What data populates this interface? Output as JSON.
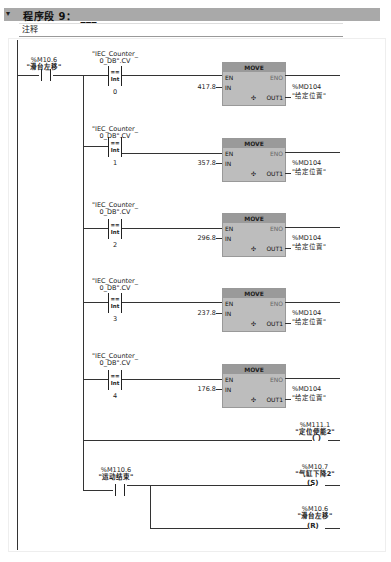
{
  "network": {
    "collapse_icon": "▾",
    "title": "程序段 9：  ___",
    "comment_label": "注释"
  },
  "rows": [
    {
      "contact": {
        "address": "%M10.6",
        "symbol": "\"滑台左移\""
      },
      "compare": {
        "operand1": "\"IEC_Counter_",
        "operand2": "0_DB\".CV",
        "op": "==",
        "type": "Int",
        "value": "0"
      },
      "move": {
        "title": "MOVE",
        "en": "EN",
        "eno": "ENO",
        "in": "IN",
        "out": "OUT1",
        "in_value": "417.8",
        "out_address": "%MD104",
        "out_symbol": "\"给定位置\""
      }
    },
    {
      "compare": {
        "operand1": "\"IEC_Counter_",
        "operand2": "0_DB\".CV",
        "op": "==",
        "type": "Int",
        "value": "1"
      },
      "move": {
        "title": "MOVE",
        "en": "EN",
        "eno": "ENO",
        "in": "IN",
        "out": "OUT1",
        "in_value": "357.8",
        "out_address": "%MD104",
        "out_symbol": "\"给定位置\""
      }
    },
    {
      "compare": {
        "operand1": "\"IEC_Counter_",
        "operand2": "0_DB\".CV",
        "op": "==",
        "type": "Int",
        "value": "2"
      },
      "move": {
        "title": "MOVE",
        "en": "EN",
        "eno": "ENO",
        "in": "IN",
        "out": "OUT1",
        "in_value": "296.8",
        "out_address": "%MD104",
        "out_symbol": "\"给定位置\""
      }
    },
    {
      "compare": {
        "operand1": "\"IEC_Counter_",
        "operand2": "0_DB\".CV",
        "op": "==",
        "type": "Int",
        "value": "3"
      },
      "move": {
        "title": "MOVE",
        "en": "EN",
        "eno": "ENO",
        "in": "IN",
        "out": "OUT1",
        "in_value": "237.8",
        "out_address": "%MD104",
        "out_symbol": "\"给定位置\""
      }
    },
    {
      "compare": {
        "operand1": "\"IEC_Counter_",
        "operand2": "0_DB\".CV",
        "op": "==",
        "type": "Int",
        "value": "4"
      },
      "move": {
        "title": "MOVE",
        "en": "EN",
        "eno": "ENO",
        "in": "IN",
        "out": "OUT1",
        "in_value": "176.8",
        "out_address": "%MD104",
        "out_symbol": "\"给定位置\""
      }
    }
  ],
  "coils": [
    {
      "address": "%M111.1",
      "symbol": "\"定位使能2\"",
      "glyph": "( )"
    },
    {
      "address": "%M10.7",
      "symbol": "\"气缸下降2\"",
      "glyph": "(S)"
    },
    {
      "address": "%M10.6",
      "symbol": "\"滑台左移\"",
      "glyph": "(R)"
    }
  ],
  "contact2": {
    "address": "%M110.6",
    "symbol": "\"运动结束\""
  },
  "move_pin_icon": "✣"
}
